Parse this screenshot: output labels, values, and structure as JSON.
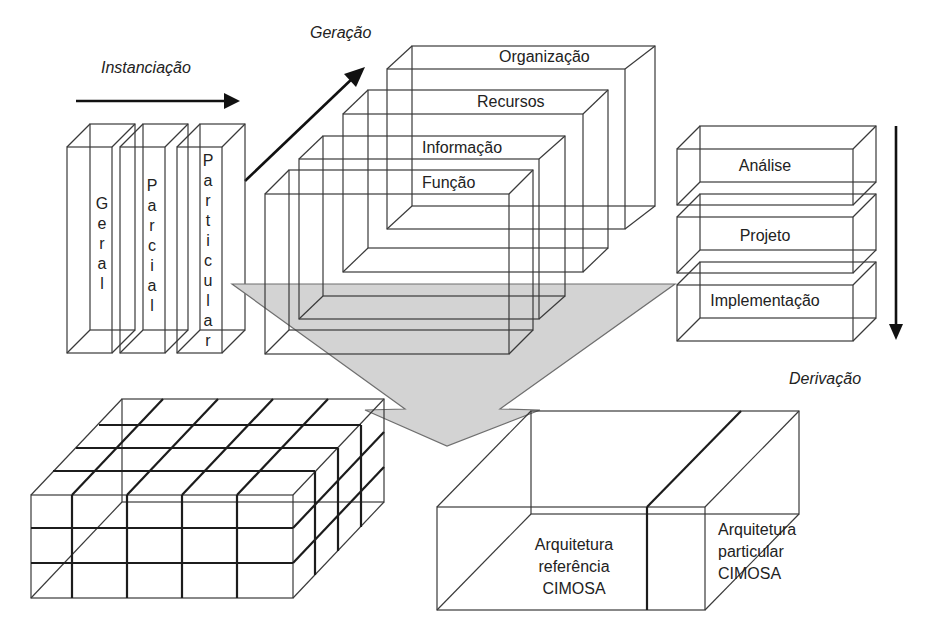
{
  "diagram": {
    "arrows": {
      "instanciacao": "Instanciação",
      "geracao": "Geração",
      "derivacao": "Derivação"
    },
    "instantiation_columns": [
      {
        "label": "Geral",
        "letters": [
          "G",
          "e",
          "r",
          "a",
          "l"
        ]
      },
      {
        "label": "Parcial",
        "letters": [
          "P",
          "a",
          "r",
          "c",
          "i",
          "a",
          "l"
        ]
      },
      {
        "label": "Particular",
        "letters": [
          "P",
          "a",
          "r",
          "t",
          "i",
          "c",
          "u",
          "l",
          "a",
          "r"
        ]
      }
    ],
    "views": [
      {
        "label": "Organização"
      },
      {
        "label": "Recursos"
      },
      {
        "label": "Informação"
      },
      {
        "label": "Função"
      }
    ],
    "derivation_levels": [
      {
        "label": "Análise"
      },
      {
        "label": "Projeto"
      },
      {
        "label": "Implementação"
      }
    ],
    "cube_grid": {
      "columns": 5,
      "rows": 3,
      "depth": 4
    },
    "output_box": {
      "reference": {
        "line1": "Arquitetura",
        "line2": "referência",
        "line3": "CIMOSA"
      },
      "particular": {
        "line1": "Arquitetura",
        "line2": "particular",
        "line3": "CIMOSA"
      }
    },
    "colors": {
      "funnel": "#d3d3d3",
      "lines": "#3a3a3a",
      "arrows": "#111111"
    }
  }
}
